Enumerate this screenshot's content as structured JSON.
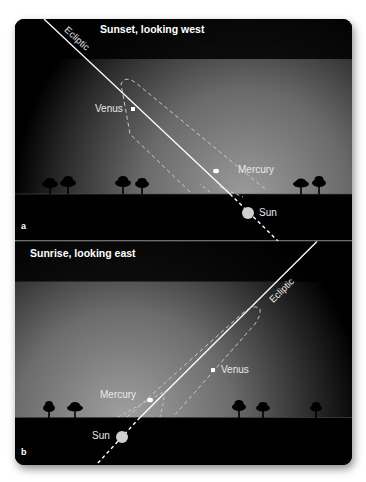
{
  "panels": [
    {
      "id": "a",
      "letter": "a",
      "title": "Sunset, looking west",
      "ecliptic_label": "Ecliptic",
      "labels": {
        "venus": "Venus",
        "mercury": "Mercury",
        "sun": "Sun"
      }
    },
    {
      "id": "b",
      "letter": "b",
      "title": "Sunrise, looking east",
      "ecliptic_label": "Ecliptic",
      "labels": {
        "venus": "Venus",
        "mercury": "Mercury",
        "sun": "Sun"
      }
    }
  ],
  "colors": {
    "sky_dark": "#000000",
    "sky_glow": "#8a8a8a",
    "ground": "#000000",
    "line": "#ffffff",
    "sun": "#cfcfcf"
  }
}
